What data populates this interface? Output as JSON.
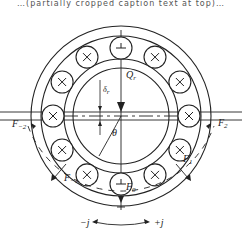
{
  "diagram": {
    "title_fragment": "…(partially cropped caption text at top)…",
    "center": {
      "x": 121,
      "y": 116
    },
    "rings": {
      "outer_outer": 90,
      "outer_inner": 80,
      "inner_outer": 57,
      "inner_inner": 48
    },
    "balls": {
      "pitch_radius": 68,
      "radius": 11,
      "count": 12,
      "marks": [
        "minus",
        "cross",
        "cross",
        "cross",
        "cross",
        "cross",
        "minus",
        "cross",
        "cross",
        "cross",
        "cross",
        "cross"
      ]
    },
    "labels": {
      "load": "Q",
      "load_sub": "r",
      "clearance": "δ",
      "clearance_sub": "r",
      "angle": "θ",
      "f0": "F",
      "f0_sub": "0",
      "f1": "F",
      "f1_sub": "1",
      "fm1": "F",
      "fm1_sub": "−1",
      "f2": "F",
      "f2_sub": "2",
      "fm2": "F",
      "fm2_sub": "−2",
      "minus_j": "−j",
      "plus_j": "+j"
    },
    "colors": {
      "stroke": "#222222",
      "background": "#ffffff"
    }
  }
}
